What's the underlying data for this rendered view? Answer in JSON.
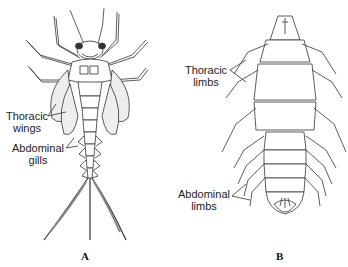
{
  "figure_a": {
    "letter": "A",
    "labels": {
      "thoracic_wings": [
        "Thoracic",
        "wings"
      ],
      "abdominal_gills": [
        "Abdominal",
        "gills"
      ]
    }
  },
  "figure_b": {
    "letter": "B",
    "labels": {
      "thoracic_limbs": [
        "Thoracic",
        "limbs"
      ],
      "abdominal_limbs": [
        "Abdominal",
        "limbs"
      ]
    }
  },
  "colors": {
    "line": "#333333",
    "background": "#ffffff"
  }
}
